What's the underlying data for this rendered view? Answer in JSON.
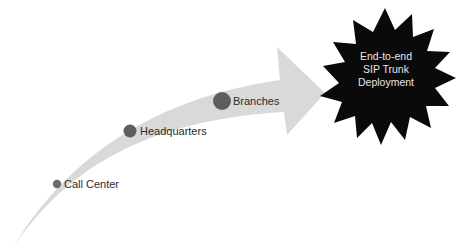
{
  "diagram": {
    "type": "progression-arrow",
    "arrow_color": "#d9d9d9",
    "milestones": [
      {
        "label": "Call Center",
        "dot_color": "#6b6b6b"
      },
      {
        "label": "Headquarters",
        "dot_color": "#5e5e5e"
      },
      {
        "label": "Branches",
        "dot_color": "#5e5e5e"
      }
    ],
    "goal": {
      "lines": [
        "End-to-end",
        "SIP Trunk",
        "Deployment"
      ],
      "shape": "starburst",
      "fill_color": "#0a0a0a",
      "text_color": "#e6e6e6"
    }
  }
}
